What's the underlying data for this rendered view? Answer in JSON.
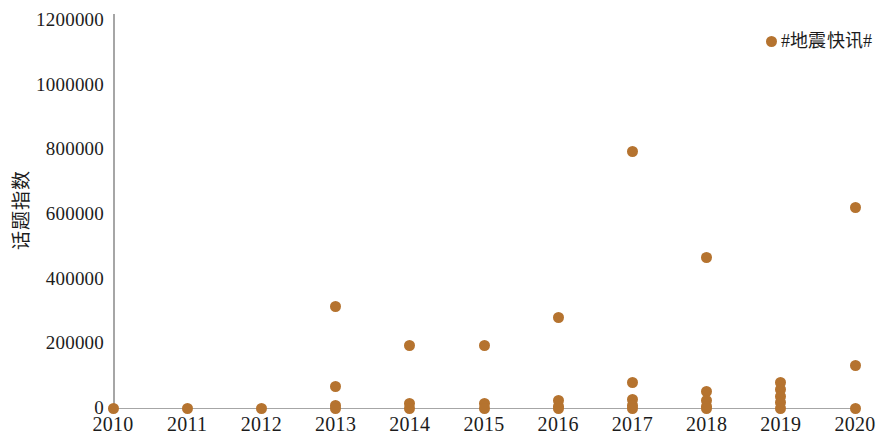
{
  "chart_data": {
    "type": "scatter",
    "title": "",
    "xlabel": "",
    "ylabel": "话题指数",
    "legend": [
      {
        "name": "#地震快讯#",
        "color": "#b5732f"
      }
    ],
    "legend_position": "top-right",
    "grid": false,
    "xlim": [
      2010,
      2020
    ],
    "ylim": [
      0,
      1200000
    ],
    "ytick_labels": [
      "1200000",
      "1000000",
      "800000",
      "600000",
      "400000",
      "200000",
      "0"
    ],
    "ytick_values": [
      1200000,
      1000000,
      800000,
      600000,
      400000,
      200000,
      0
    ],
    "xtick_labels": [
      "2010",
      "2011",
      "2012",
      "2013",
      "2014",
      "2015",
      "2016",
      "2017",
      "2018",
      "2019",
      "2020"
    ],
    "xtick_values": [
      2010,
      2011,
      2012,
      2013,
      2014,
      2015,
      2016,
      2017,
      2018,
      2019,
      2020
    ],
    "series": [
      {
        "name": "#地震快讯#",
        "color": "#b5732f",
        "points": [
          {
            "x": 2010,
            "y": 0
          },
          {
            "x": 2011,
            "y": 0
          },
          {
            "x": 2012,
            "y": 0
          },
          {
            "x": 2013,
            "y": 313000
          },
          {
            "x": 2013,
            "y": 65000
          },
          {
            "x": 2013,
            "y": 8000
          },
          {
            "x": 2013,
            "y": 0
          },
          {
            "x": 2014,
            "y": 193000
          },
          {
            "x": 2014,
            "y": 14000
          },
          {
            "x": 2014,
            "y": 0
          },
          {
            "x": 2015,
            "y": 192000
          },
          {
            "x": 2015,
            "y": 14000
          },
          {
            "x": 2015,
            "y": 0
          },
          {
            "x": 2016,
            "y": 280000
          },
          {
            "x": 2016,
            "y": 24000
          },
          {
            "x": 2016,
            "y": 6000
          },
          {
            "x": 2016,
            "y": 0
          },
          {
            "x": 2017,
            "y": 792000
          },
          {
            "x": 2017,
            "y": 79000
          },
          {
            "x": 2017,
            "y": 25000
          },
          {
            "x": 2017,
            "y": 8000
          },
          {
            "x": 2017,
            "y": 0
          },
          {
            "x": 2018,
            "y": 465000
          },
          {
            "x": 2018,
            "y": 52000
          },
          {
            "x": 2018,
            "y": 22000
          },
          {
            "x": 2018,
            "y": 5000
          },
          {
            "x": 2018,
            "y": 0
          },
          {
            "x": 2019,
            "y": 78000
          },
          {
            "x": 2019,
            "y": 58000
          },
          {
            "x": 2019,
            "y": 36000
          },
          {
            "x": 2019,
            "y": 18000
          },
          {
            "x": 2019,
            "y": 0
          },
          {
            "x": 2020,
            "y": 620000
          },
          {
            "x": 2020,
            "y": 130000
          },
          {
            "x": 2020,
            "y": 0
          }
        ]
      }
    ]
  }
}
